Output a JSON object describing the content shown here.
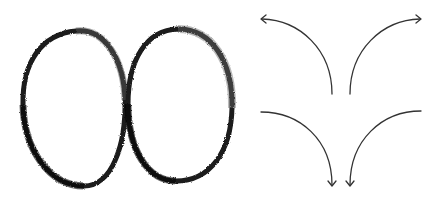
{
  "canvas": {
    "width": 440,
    "height": 197,
    "background": "#ffffff"
  },
  "colors": {
    "stroke": "#111111",
    "arrow": "#333333"
  },
  "figures": {
    "left_ellipse": {
      "label": "charcoal-ring-left"
    },
    "right_ellipse": {
      "label": "charcoal-ring-right"
    },
    "arrows": [
      {
        "name": "arrow-up-left",
        "direction": "up-left"
      },
      {
        "name": "arrow-up-right",
        "direction": "up-right"
      },
      {
        "name": "arrow-down-left",
        "direction": "down-left"
      },
      {
        "name": "arrow-down-right",
        "direction": "down-right"
      }
    ]
  }
}
